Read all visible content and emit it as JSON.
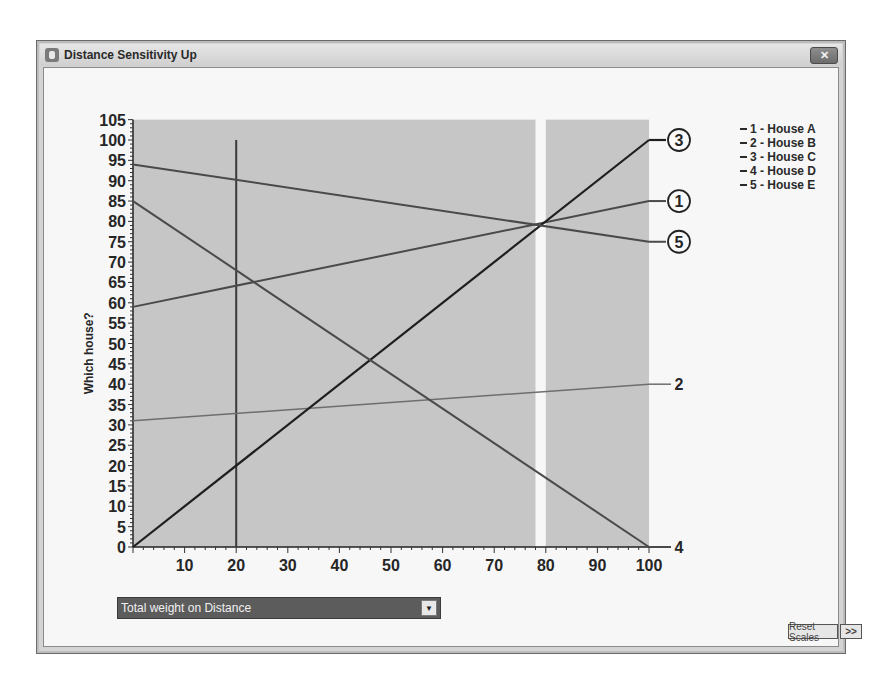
{
  "window": {
    "title": "Distance Sensitivity Up",
    "close_label": "✕"
  },
  "chart_data": {
    "type": "line",
    "title": "Distance Sensitivity Up",
    "xlabel": "Total weight on Distance",
    "ylabel": "Which house?",
    "xlim": [
      0,
      100
    ],
    "ylim": [
      0,
      105
    ],
    "x_ticks": [
      10,
      20,
      30,
      40,
      50,
      60,
      70,
      80,
      90,
      100
    ],
    "y_ticks": [
      0,
      5,
      10,
      15,
      20,
      25,
      30,
      35,
      40,
      45,
      50,
      55,
      60,
      65,
      70,
      75,
      80,
      85,
      90,
      95,
      100,
      105
    ],
    "current_weight_marker": 20,
    "gap_band": [
      78,
      80
    ],
    "x": [
      0,
      100
    ],
    "series": [
      {
        "id": "1",
        "name": "House A",
        "values": [
          59,
          85
        ],
        "label_style": "circled"
      },
      {
        "id": "2",
        "name": "House B",
        "values": [
          31,
          40
        ],
        "label_style": "plain"
      },
      {
        "id": "3",
        "name": "House C",
        "values": [
          0,
          100
        ],
        "label_style": "circled"
      },
      {
        "id": "4",
        "name": "House D",
        "values": [
          85,
          0
        ],
        "label_style": "plain"
      },
      {
        "id": "5",
        "name": "House E",
        "values": [
          94,
          75
        ],
        "label_style": "circled"
      }
    ],
    "legend_position": "right"
  },
  "legend": {
    "items": [
      {
        "label": "1 - House A"
      },
      {
        "label": "2 - House B"
      },
      {
        "label": "3 - House C"
      },
      {
        "label": "4 - House D"
      },
      {
        "label": "5 - House E"
      }
    ]
  },
  "controls": {
    "weight_dropdown_value": "Total weight on Distance",
    "dropdown_arrow": "▼",
    "reset_scales_label": "Reset Scales",
    "more_label": ">>"
  },
  "colors": {
    "plot_fill": "#c6c6c6",
    "line_dark": "#1e1e1e",
    "line_medium": "#4a4a4a",
    "line_light": "#6e6e6e",
    "dropdown_bg": "#5c5c5c"
  }
}
